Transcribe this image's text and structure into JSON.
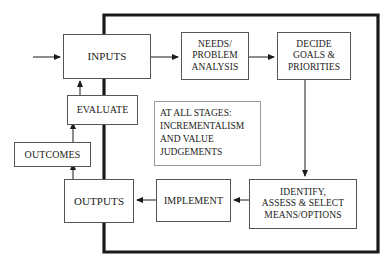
{
  "diagram": {
    "background_color": "#ffffff",
    "line_color": "#333333",
    "box_border_color": "#555555",
    "nodes": {
      "inputs": {
        "label": "INPUTS"
      },
      "needs_problem_analysis": {
        "label": "NEEDS/\nPROBLEM\nANALYSIS"
      },
      "decide_goals": {
        "label": "DECIDE\nGOALS &\nPRIORITIES"
      },
      "evaluate": {
        "label": "EVALUATE"
      },
      "outcomes": {
        "label": "OUTCOMES"
      },
      "outputs": {
        "label": "OUTPUTS"
      },
      "implement": {
        "label": "IMPLEMENT"
      },
      "identify_assess_select": {
        "label": "IDENTIFY,\nASSESS & SELECT\nMEANS/OPTIONS"
      }
    },
    "annotations": {
      "all_stages_note": "AT ALL STAGES:\nINCREMENTALISM\nAND VALUE\nJUDGEMENTS"
    },
    "connectors": [
      {
        "name": "external-input-to-inputs",
        "from": "external",
        "to": "inputs",
        "style": "thin-arrow"
      },
      {
        "name": "inputs-to-needs",
        "from": "inputs",
        "to": "needs_problem_analysis",
        "style": "thin-arrow"
      },
      {
        "name": "needs-to-decide",
        "from": "needs_problem_analysis",
        "to": "decide_goals",
        "style": "thin-arrow"
      },
      {
        "name": "decide-to-identify",
        "from": "decide_goals",
        "to": "identify_assess_select",
        "style": "thin-arrow"
      },
      {
        "name": "identify-to-implement",
        "from": "identify_assess_select",
        "to": "implement",
        "style": "thin-arrow"
      },
      {
        "name": "implement-to-outputs",
        "from": "implement",
        "to": "outputs",
        "style": "thin-arrow"
      },
      {
        "name": "outputs-to-outcomes",
        "from": "outputs",
        "to": "outcomes",
        "style": "thin-arrow"
      },
      {
        "name": "outcomes-to-evaluate",
        "from": "outcomes",
        "to": "evaluate",
        "style": "thin-arrow"
      },
      {
        "name": "evaluate-to-inputs",
        "from": "evaluate",
        "to": "inputs",
        "style": "thin-arrow"
      },
      {
        "name": "feedback-loop-frame",
        "from": "outputs",
        "to": "inputs",
        "style": "thick-loop"
      }
    ]
  }
}
